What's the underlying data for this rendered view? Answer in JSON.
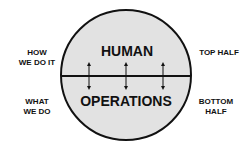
{
  "diagram": {
    "top_label": "HUMAN",
    "bottom_label": "OPERATIONS",
    "left_top": [
      "HOW",
      "WE DO IT"
    ],
    "left_bottom": [
      "WHAT",
      "WE DO"
    ],
    "right_top": [
      "TOP HALF"
    ],
    "right_bottom": [
      "BOTTOM",
      "HALF"
    ],
    "fill_color": "#e2e2e2",
    "stroke_color": "#111111",
    "arrows": 3
  }
}
